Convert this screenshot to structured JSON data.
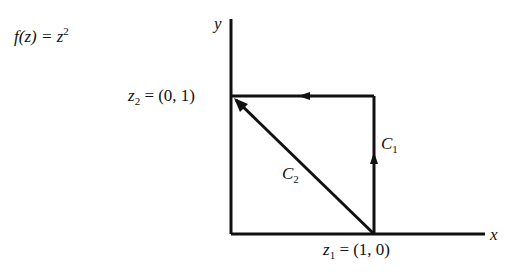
{
  "function_label": {
    "lhs": "f(z) = z",
    "exp": "2"
  },
  "axes": {
    "x_label": "x",
    "y_label": "y"
  },
  "points": {
    "z2": {
      "name": "z",
      "sub": "2",
      "value": " = (0, 1)"
    },
    "z1": {
      "name": "z",
      "sub": "1",
      "value": " = (1, 0)"
    }
  },
  "paths": {
    "c1": {
      "name": "C",
      "sub": "1"
    },
    "c2": {
      "name": "C",
      "sub": "2"
    }
  },
  "colors": {
    "stroke": "#111111",
    "background": "#ffffff"
  }
}
